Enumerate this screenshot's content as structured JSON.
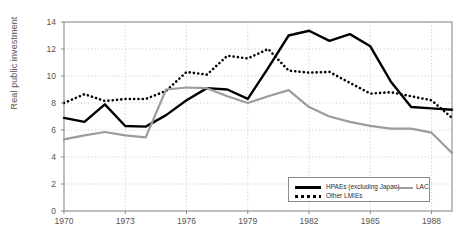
{
  "chart_data": {
    "type": "line",
    "title": "",
    "xlabel": "",
    "ylabel": "Real public investment",
    "xlim": [
      1970,
      1989
    ],
    "ylim": [
      0,
      14
    ],
    "grid": true,
    "legend_position": "bottom-right",
    "x": [
      1970,
      1971,
      1972,
      1973,
      1974,
      1975,
      1976,
      1977,
      1978,
      1979,
      1980,
      1981,
      1982,
      1983,
      1984,
      1985,
      1986,
      1987,
      1988,
      1989
    ],
    "xticks": [
      1970,
      1973,
      1976,
      1979,
      1982,
      1985,
      1988
    ],
    "yticks": [
      0,
      2,
      4,
      6,
      8,
      10,
      12,
      14
    ],
    "series": [
      {
        "name": "HPAEs (excluding Japan)",
        "style": "solid",
        "color": "#000000",
        "values": [
          6.9,
          6.6,
          7.9,
          6.3,
          6.25,
          7.1,
          8.2,
          9.1,
          9.0,
          8.3,
          10.6,
          13.0,
          13.35,
          12.6,
          13.1,
          12.2,
          9.6,
          7.7,
          7.6,
          7.5
        ]
      },
      {
        "name": "Other LMIEs",
        "style": "dotted",
        "color": "#000000",
        "values": [
          8.0,
          8.65,
          8.15,
          8.3,
          8.3,
          8.9,
          10.3,
          10.1,
          11.5,
          11.3,
          12.0,
          10.4,
          10.25,
          10.3,
          9.5,
          8.7,
          8.8,
          8.5,
          8.2,
          6.9
        ]
      },
      {
        "name": "LAC",
        "style": "solid",
        "color": "#9c9c9c",
        "values": [
          5.3,
          5.6,
          5.85,
          5.6,
          5.45,
          9.0,
          9.15,
          9.1,
          8.5,
          8.0,
          8.5,
          8.95,
          7.7,
          7.0,
          6.6,
          6.3,
          6.1,
          6.1,
          5.8,
          4.3
        ]
      }
    ]
  },
  "axes": {
    "y_tick_labels": [
      "0",
      "2",
      "4",
      "6",
      "8",
      "10",
      "12",
      "14"
    ],
    "x_tick_labels": [
      "1970",
      "1973",
      "1976",
      "1979",
      "1982",
      "1985",
      "1988"
    ],
    "y_axis_title": "Real public investment"
  },
  "legend": {
    "entries": [
      {
        "label": "HPAEs (excluding Japan)",
        "style": "solid",
        "color": "#000000"
      },
      {
        "label": "Other LMIEs",
        "style": "dotted",
        "color": "#000000"
      },
      {
        "label": "LAC",
        "style": "solid",
        "color": "#9c9c9c"
      }
    ]
  },
  "colors": {
    "background": "#ffffff",
    "axis": "#8a8a8a",
    "grid": "#c2c2c2",
    "text": "#555555",
    "series_black": "#000000",
    "series_gray": "#9c9c9c"
  }
}
